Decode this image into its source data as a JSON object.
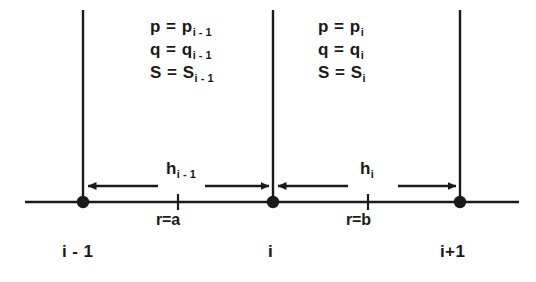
{
  "figure": {
    "type": "finite-difference-grid-stencil",
    "colors": {
      "ink": "#1a1a1a",
      "background": "#ffffff"
    }
  },
  "cells": [
    {
      "id": "cell-left",
      "properties": [
        {
          "lhs": "p = p",
          "sub": "i - 1"
        },
        {
          "lhs": "q = q",
          "sub": "i - 1"
        },
        {
          "lhs": "S = S",
          "sub": "i - 1"
        }
      ]
    },
    {
      "id": "cell-right",
      "properties": [
        {
          "lhs": "p = p",
          "sub": "i"
        },
        {
          "lhs": "q = q",
          "sub": "i"
        },
        {
          "lhs": "S = S",
          "sub": "i"
        }
      ]
    }
  ],
  "spacings": [
    {
      "id": "h-left",
      "symbol": "h",
      "sub": "i - 1"
    },
    {
      "id": "h-right",
      "symbol": "h",
      "sub": "i"
    }
  ],
  "interfaces": [
    {
      "id": "interface-a",
      "label": "r=a"
    },
    {
      "id": "interface-b",
      "label": "r=b"
    }
  ],
  "nodes": [
    {
      "id": "node-i-minus-1",
      "label": "i - 1"
    },
    {
      "id": "node-i",
      "label": "i"
    },
    {
      "id": "node-i-plus-1",
      "label": "i+1"
    }
  ]
}
